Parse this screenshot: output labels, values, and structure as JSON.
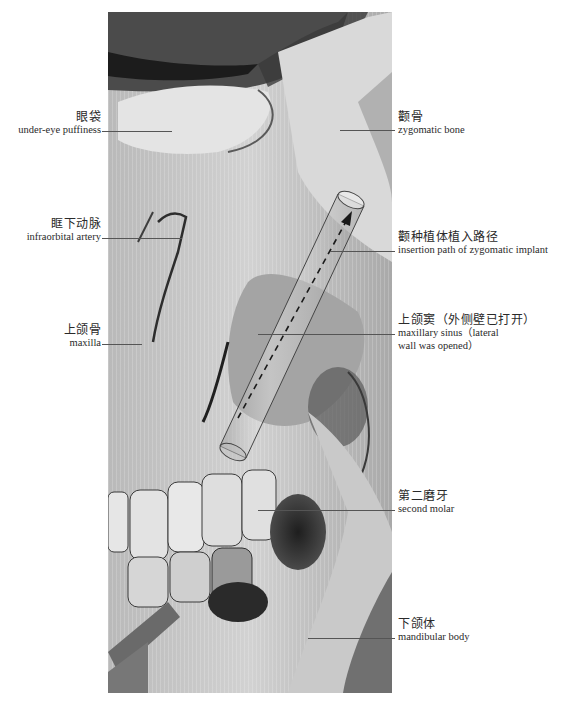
{
  "figure": {
    "photo": {
      "description": "Grayscale cadaver dissection photo of the lateral face showing eye, zygoma, maxilla with opened maxillary sinus, teeth, and mandible, with a translucent cylinder overlay indicating zygomatic implant insertion path",
      "overlay": {
        "type": "cylinder",
        "arrow": "dashed",
        "direction": "upward-right"
      }
    },
    "labels": [
      {
        "id": "under-eye-puffiness",
        "side": "left",
        "zh": "眼袋",
        "en": "under-eye puffiness"
      },
      {
        "id": "infraorbital-artery",
        "side": "left",
        "zh": "眶下动脉",
        "en": "infraorbital artery"
      },
      {
        "id": "maxilla",
        "side": "left",
        "zh": "上颌骨",
        "en": "maxilla"
      },
      {
        "id": "zygomatic-bone",
        "side": "right",
        "zh": "颧骨",
        "en": "zygomatic bone"
      },
      {
        "id": "insertion-path",
        "side": "right",
        "zh": "颧种植体植入路径",
        "en": "insertion path of zygomatic implant"
      },
      {
        "id": "maxillary-sinus",
        "side": "right",
        "zh": "上颌窦（外侧壁已打开）",
        "en_line1": "maxillary sinus（lateral",
        "en_line2": "wall was opened）"
      },
      {
        "id": "second-molar",
        "side": "right",
        "zh": "第二磨牙",
        "en": "second molar"
      },
      {
        "id": "mandibular-body",
        "side": "right",
        "zh": "下颌体",
        "en": "mandibular body"
      }
    ]
  }
}
